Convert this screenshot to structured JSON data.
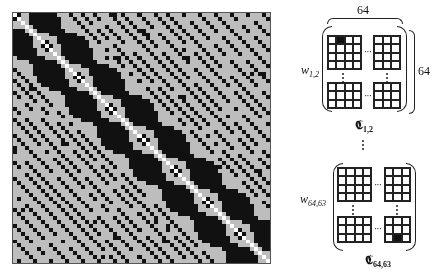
{
  "figure": {
    "matrix": {
      "size": 64,
      "colors": {
        "background": "#bdbdbd",
        "filled": "#111111",
        "diagonal_dot": "#ffffff",
        "border": "#555555"
      },
      "block_period": 8,
      "band_max_offset": 11,
      "sparse_diagonal_offsets": [
        14,
        17,
        20,
        24,
        27,
        31,
        35,
        38,
        42,
        46,
        50,
        54,
        58,
        62
      ]
    },
    "top_block": {
      "width_label": "64",
      "height_label": "64",
      "row_label_base": "w",
      "row_label_sub": "1,2",
      "caption_base": "𝕮",
      "caption_sub": "1,2",
      "highlight": "top-left-grid row 0 col 1"
    },
    "separator": "⋮",
    "bottom_block": {
      "row_label_base": "w",
      "row_label_sub": "64,63",
      "caption_base": "𝕮",
      "caption_sub": "64,63",
      "highlight": "bottom-right-grid row 2 col 1"
    },
    "ellipsis_h": "···"
  }
}
